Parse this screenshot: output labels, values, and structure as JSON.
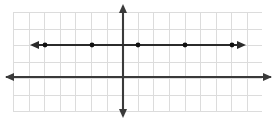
{
  "figure": {
    "width": 277,
    "height": 121,
    "background_color": "#ffffff",
    "title": ""
  },
  "colors": {
    "background": "#ffffff",
    "grid": "#dcdcdc",
    "axis": "#3a3a3a",
    "plot_line": "#2b2b2b",
    "point": "#111111"
  },
  "chart_data": {
    "type": "line",
    "title": "",
    "xlabel": "",
    "ylabel": "",
    "grid": true,
    "legend": null,
    "axis_arrows": {
      "x_left": true,
      "x_right": true,
      "y_top": true,
      "y_bottom": true
    },
    "xlim": [
      -7,
      9
    ],
    "ylim": [
      -4,
      2
    ],
    "x_ticks": [
      -7,
      -6,
      -5,
      -4,
      -3,
      -2,
      -1,
      0,
      1,
      2,
      3,
      4,
      5,
      6,
      7,
      8,
      9
    ],
    "y_ticks": [
      -4,
      -3,
      -2,
      -1,
      0,
      1,
      2
    ],
    "tick_labels_shown": false,
    "series": [
      {
        "name": "horizontal-line",
        "equation": "y = 2",
        "style": "solid",
        "arrows": {
          "left": true,
          "right": true
        },
        "x": [
          -6.8,
          -5,
          -2,
          1,
          4,
          7,
          7.7
        ],
        "y": [
          2,
          2,
          2,
          2,
          2,
          2,
          2
        ],
        "points": [
          {
            "x": -5,
            "y": 2
          },
          {
            "x": -2,
            "y": 2
          },
          {
            "x": 1,
            "y": 2
          },
          {
            "x": 4,
            "y": 2
          },
          {
            "x": 7,
            "y": 2
          }
        ]
      }
    ]
  },
  "geometry": {
    "grid": {
      "left": 13,
      "top": 12,
      "right": 262,
      "bottom": 111,
      "cell_width": 15.6,
      "cell_height": 16.5,
      "columns": 16,
      "rows": 6
    },
    "y_axis_x": 123,
    "x_axis_y": 77,
    "plot_line_y": 45,
    "plot_line_start_x": 31,
    "plot_line_end_x": 245,
    "dot_x_positions": [
      45,
      92,
      138,
      185,
      232
    ],
    "dot_radius": 2.4
  }
}
